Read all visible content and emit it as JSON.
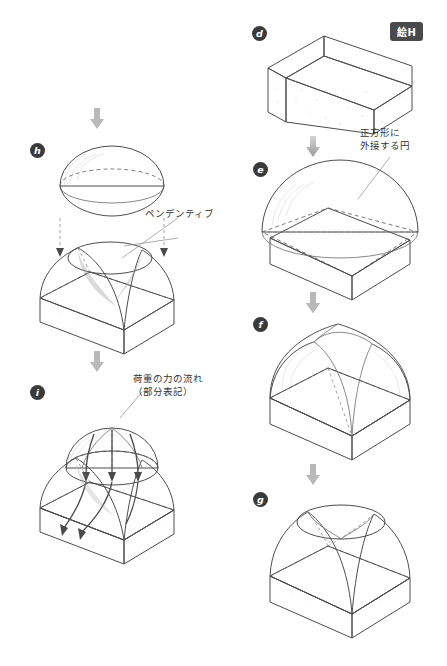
{
  "figure": {
    "badge_label": "絵H",
    "background": "#ffffff",
    "ink_color": "#4c4c4c",
    "marker_color": "#3a3a3a"
  },
  "stages": [
    {
      "id": "d",
      "marker": "d",
      "caption": "",
      "x": 252,
      "y": 26,
      "description": "square cubic base / drum, open top"
    },
    {
      "id": "e",
      "marker": "e",
      "caption": "",
      "x": 253,
      "y": 162,
      "description": "hemisphere circumscribing the square base"
    },
    {
      "id": "f",
      "marker": "f",
      "caption": "",
      "x": 253,
      "y": 317,
      "description": "hemisphere cut by four vertical planes over the walls"
    },
    {
      "id": "g",
      "marker": "g",
      "caption": "",
      "x": 253,
      "y": 492,
      "description": "horizontal cut producing pendentives and circular crown ring"
    },
    {
      "id": "h",
      "marker": "h",
      "caption": "",
      "x": 30,
      "y": 143,
      "description": "dome cap lowered onto the pendentive crown ring"
    },
    {
      "id": "i",
      "marker": "i",
      "caption": "",
      "x": 30,
      "y": 385,
      "description": "completed pendentive dome with load force flow"
    }
  ],
  "annotations": [
    {
      "id": "circumscribed-circle",
      "text": "正方形に\n外接する円",
      "x": 360,
      "y": 131
    },
    {
      "id": "pendentive",
      "text": "ペンデンティブ",
      "x": 145,
      "y": 207
    },
    {
      "id": "load-flow",
      "text": "荷重の力の流れ\n（部分表記）",
      "x": 133,
      "y": 372
    }
  ],
  "arrows": [
    {
      "id": "arrow-d-to-e",
      "x": 312,
      "y": 142
    },
    {
      "id": "arrow-e-to-f",
      "x": 312,
      "y": 298
    },
    {
      "id": "arrow-f-to-g",
      "x": 312,
      "y": 470
    },
    {
      "id": "arrow-to-h",
      "x": 96,
      "y": 112
    },
    {
      "id": "arrow-h-to-i",
      "x": 96,
      "y": 355
    }
  ]
}
